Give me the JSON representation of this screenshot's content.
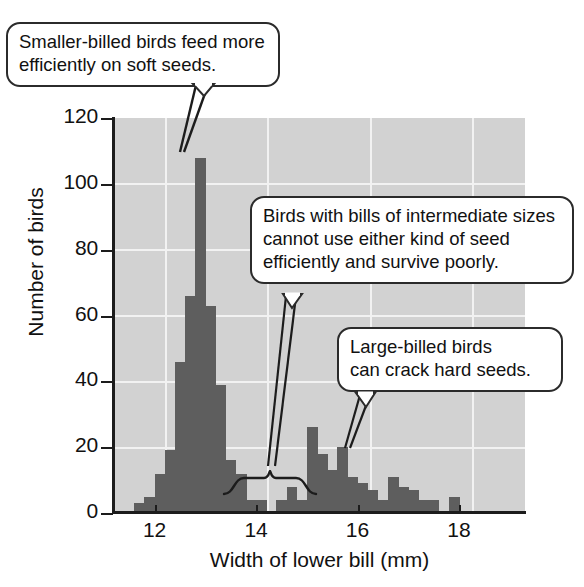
{
  "figure": {
    "title": "",
    "background_color": "#ffffff",
    "plot_background_color": "#d2d2d2",
    "bar_color": "#5e5e5e",
    "gridline_color": "#f2f2f2",
    "axis_color": "#1c1c1c"
  },
  "annotations": [
    {
      "id": "callout-smaller-billed",
      "text": "Smaller-billed birds feed more efficiently on soft seeds.",
      "line1": "Smaller-billed birds feed more",
      "line2": "efficiently on soft seeds.",
      "points_to": "left peak of histogram (~12.8 mm)"
    },
    {
      "id": "callout-intermediate",
      "text": "Birds with bills of intermediate sizes cannot use either kind of seed efficiently and survive poorly.",
      "line1": "Birds with bills of intermediate sizes",
      "line2": "cannot use either kind of seed",
      "line3": "efficiently and survive poorly.",
      "points_to": "gap between modes (~14.0-14.8 mm)"
    },
    {
      "id": "callout-large-billed",
      "text": "Large-billed birds can crack hard seeds.",
      "line1": "Large-billed birds",
      "line2": "can crack hard seeds.",
      "points_to": "right peak of histogram (~15.6 mm)"
    }
  ],
  "chart_data": {
    "type": "bar",
    "title": "",
    "subtitle": "",
    "xlabel": "Width of lower bill (mm)",
    "ylabel": "Number of birds",
    "xlim": [
      11.2,
      19.3
    ],
    "ylim": [
      0,
      120
    ],
    "xticks": [
      12,
      14,
      16,
      18
    ],
    "xtick_labels": [
      "12",
      "14",
      "16",
      "18"
    ],
    "yticks": [
      0,
      20,
      40,
      60,
      80,
      100,
      120
    ],
    "ytick_labels": [
      "0",
      "20",
      "40",
      "60",
      "80",
      "100",
      "120"
    ],
    "grid": true,
    "grid_axis": "both",
    "legend": null,
    "bin_width": 0.2,
    "categories": [
      "11.6",
      "11.8",
      "12.0",
      "12.2",
      "12.4",
      "12.6",
      "12.8",
      "13.0",
      "13.2",
      "13.4",
      "13.6",
      "13.8",
      "14.0",
      "14.2",
      "14.4",
      "14.6",
      "14.8",
      "15.0",
      "15.2",
      "15.4",
      "15.6",
      "15.8",
      "16.0",
      "16.2",
      "16.4",
      "16.6",
      "16.8",
      "17.0",
      "17.2",
      "17.4",
      "17.6",
      "17.8"
    ],
    "values": [
      3,
      5,
      12,
      19,
      46,
      66,
      108,
      63,
      39,
      16,
      12,
      4,
      4,
      0,
      4,
      8,
      4,
      26,
      18,
      13,
      20,
      11,
      9,
      7,
      4,
      11,
      8,
      7,
      4,
      4,
      0,
      5
    ]
  }
}
